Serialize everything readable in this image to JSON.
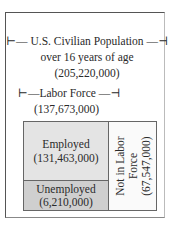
{
  "population": {
    "title": "U.S. Civilian Population",
    "subtitle": "over 16 years of age",
    "value": "(205,220,000)",
    "bracket_left": "⊢",
    "bracket_right": "⊣"
  },
  "labor_force": {
    "title": "Labor Force",
    "value": "(137,673,000)"
  },
  "employed": {
    "label": "Employed",
    "value": "(131,463,000)"
  },
  "unemployed": {
    "label": "Unemployed",
    "value": "(6,210,000)"
  },
  "not_in_labor_force": {
    "line1": "Not in Labor",
    "line2": "Force",
    "value": "(67,547,000)"
  },
  "colors": {
    "employed": "#e4e4e4",
    "unemployed": "#cfcfcf",
    "border": "#666666"
  }
}
